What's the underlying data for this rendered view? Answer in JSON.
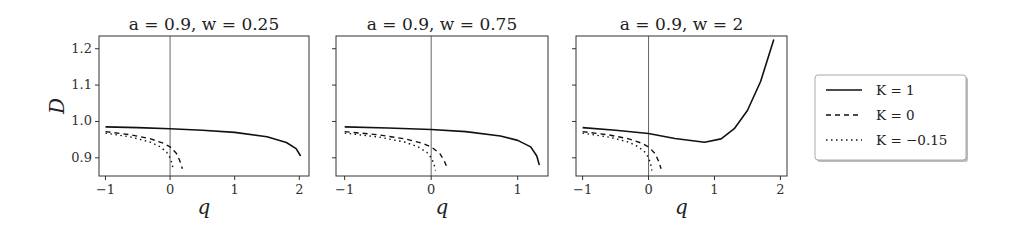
{
  "chart_data": [
    {
      "type": "line",
      "title": "a = 0.9, w = 0.25",
      "xlabel": "q",
      "ylabel": "D",
      "xlim": [
        -1.1,
        2.15
      ],
      "ylim": [
        0.85,
        1.235
      ],
      "xticks": [
        -1,
        0,
        1,
        2
      ],
      "yticks": [
        0.9,
        1.0,
        1.1,
        1.2
      ],
      "vline_x": 0,
      "grid": false,
      "series": [
        {
          "name": "K = 1",
          "style": "solid",
          "x": [
            -1.0,
            -0.5,
            0.0,
            0.5,
            1.0,
            1.5,
            1.8,
            1.95,
            2.02
          ],
          "y": [
            0.985,
            0.983,
            0.98,
            0.976,
            0.97,
            0.958,
            0.942,
            0.925,
            0.905
          ]
        },
        {
          "name": "K = 0",
          "style": "dashed",
          "x": [
            -1.0,
            -0.6,
            -0.3,
            -0.1,
            0.0,
            0.1,
            0.15,
            0.19
          ],
          "y": [
            0.972,
            0.963,
            0.952,
            0.94,
            0.93,
            0.912,
            0.892,
            0.87
          ]
        },
        {
          "name": "K = -0.15",
          "style": "dotted",
          "x": [
            -1.0,
            -0.6,
            -0.3,
            -0.15,
            -0.05,
            0.0,
            0.03,
            0.05
          ],
          "y": [
            0.968,
            0.957,
            0.943,
            0.93,
            0.915,
            0.9,
            0.885,
            0.865
          ]
        }
      ]
    },
    {
      "type": "line",
      "title": "a = 0.9, w = 0.75",
      "xlabel": "q",
      "ylabel": "",
      "xlim": [
        -1.1,
        1.35
      ],
      "ylim": [
        0.85,
        1.235
      ],
      "xticks": [
        -1,
        0,
        1
      ],
      "yticks": [
        0.9,
        1.0,
        1.1,
        1.2
      ],
      "vline_x": 0,
      "grid": false,
      "series": [
        {
          "name": "K = 1",
          "style": "solid",
          "x": [
            -1.0,
            -0.5,
            0.0,
            0.4,
            0.8,
            1.0,
            1.15,
            1.22,
            1.25
          ],
          "y": [
            0.985,
            0.982,
            0.978,
            0.972,
            0.96,
            0.948,
            0.93,
            0.905,
            0.88
          ]
        },
        {
          "name": "K = 0",
          "style": "dashed",
          "x": [
            -1.0,
            -0.6,
            -0.3,
            -0.1,
            0.0,
            0.1,
            0.15,
            0.19
          ],
          "y": [
            0.972,
            0.963,
            0.952,
            0.94,
            0.93,
            0.912,
            0.892,
            0.87
          ]
        },
        {
          "name": "K = -0.15",
          "style": "dotted",
          "x": [
            -1.0,
            -0.6,
            -0.3,
            -0.15,
            -0.05,
            0.0,
            0.03,
            0.05
          ],
          "y": [
            0.968,
            0.957,
            0.943,
            0.93,
            0.915,
            0.9,
            0.885,
            0.865
          ]
        }
      ]
    },
    {
      "type": "line",
      "title": "a = 0.9, w = 2",
      "xlabel": "q",
      "ylabel": "",
      "xlim": [
        -1.1,
        2.1
      ],
      "ylim": [
        0.85,
        1.235
      ],
      "xticks": [
        -1,
        0,
        1,
        2
      ],
      "yticks": [
        0.9,
        1.0,
        1.1,
        1.2
      ],
      "vline_x": 0,
      "grid": false,
      "series": [
        {
          "name": "K = 1",
          "style": "solid",
          "x": [
            -1.0,
            -0.5,
            0.0,
            0.4,
            0.85,
            1.1,
            1.3,
            1.5,
            1.7,
            1.9
          ],
          "y": [
            0.983,
            0.976,
            0.967,
            0.953,
            0.943,
            0.952,
            0.98,
            1.03,
            1.11,
            1.225
          ]
        },
        {
          "name": "K = 0",
          "style": "dashed",
          "x": [
            -1.0,
            -0.6,
            -0.3,
            -0.1,
            0.0,
            0.1,
            0.15,
            0.19
          ],
          "y": [
            0.972,
            0.963,
            0.952,
            0.94,
            0.93,
            0.912,
            0.892,
            0.87
          ]
        },
        {
          "name": "K = -0.15",
          "style": "dotted",
          "x": [
            -1.0,
            -0.6,
            -0.3,
            -0.15,
            -0.05,
            0.0,
            0.03,
            0.05
          ],
          "y": [
            0.968,
            0.957,
            0.943,
            0.93,
            0.915,
            0.9,
            0.885,
            0.865
          ]
        }
      ]
    }
  ],
  "legend": {
    "position": "right",
    "entries": [
      {
        "label": "K = 1",
        "style": "solid"
      },
      {
        "label": "K = 0",
        "style": "dashed"
      },
      {
        "label": "K = −0.15",
        "style": "dotted"
      }
    ]
  },
  "colors": {
    "line": "#111111",
    "axis": "#333333",
    "vline": "#555555",
    "legend_border": "#999999"
  }
}
